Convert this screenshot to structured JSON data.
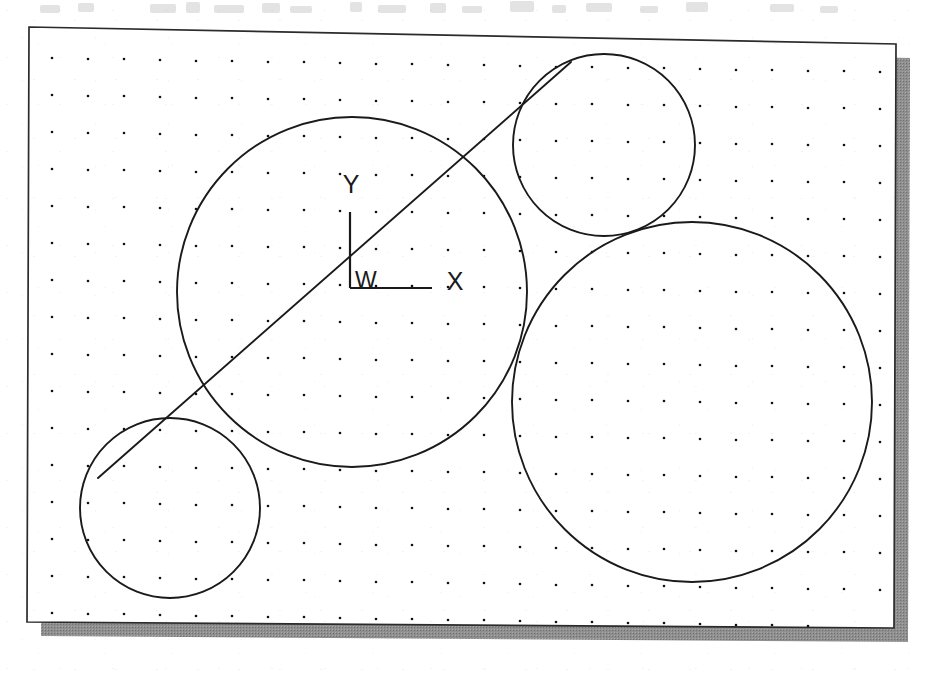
{
  "document": {
    "type": "cad-drawing",
    "title": "Tangent circles construction",
    "media": "scanned-page",
    "background_color": "#ffffff",
    "ink_color": "#1a1a1a",
    "shadow_color": "#8c8c8c"
  },
  "sheet": {
    "name": "drawing-sheet",
    "border_color": "#2b2b2b",
    "fill_color": "#ffffff",
    "corners": {
      "top_left": [
        29,
        27
      ],
      "top_right": [
        896,
        44
      ],
      "bottom_right": [
        894,
        628
      ],
      "bottom_left": [
        27,
        622
      ]
    },
    "shadow": {
      "offset_x": 14,
      "offset_y": 14,
      "color": "#8c8c8c"
    }
  },
  "grid": {
    "name": "snap-dot-grid",
    "visible": true,
    "dot_color": "#111111",
    "spacing_x": 36,
    "spacing_y": 37,
    "origin_x": 52,
    "origin_y": 58,
    "dot_radius": 1.3
  },
  "ucs_icon": {
    "name": "world-coordinate-system-icon",
    "origin_label": "W",
    "x_axis_label": "X",
    "y_axis_label": "Y",
    "origin_px": [
      350,
      288
    ],
    "x_axis_end_px": [
      432,
      288
    ],
    "y_axis_end_px": [
      350,
      212
    ],
    "description": "World coordinate system marker"
  },
  "chart_data": {
    "type": "scatter",
    "xlabel": "X",
    "ylabel": "Y",
    "grid": true,
    "legend": "none",
    "units": "pixels",
    "circles": [
      {
        "id": "circle-large-center",
        "label": "Large central circle",
        "cx": 352,
        "cy": 292,
        "r": 175
      },
      {
        "id": "circle-top-right",
        "label": "Upper right circle",
        "cx": 604,
        "cy": 145,
        "r": 91
      },
      {
        "id": "circle-right-large",
        "label": "Right large circle",
        "cx": 692,
        "cy": 402,
        "r": 180
      },
      {
        "id": "circle-lower-left",
        "label": "Lower left circle",
        "cx": 170,
        "cy": 508,
        "r": 90
      }
    ],
    "lines": [
      {
        "id": "tangent-line",
        "label": "Common external tangent",
        "x1": 98,
        "y1": 478,
        "x2": 571,
        "y2": 62
      }
    ]
  }
}
